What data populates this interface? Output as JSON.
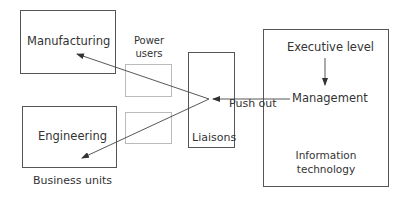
{
  "diagram": {
    "business_units": {
      "caption": "Business units",
      "manufacturing": "Manufacturing",
      "engineering": "Engineering"
    },
    "power_users": {
      "label_line1": "Power",
      "label_line2": "users"
    },
    "liaisons": {
      "label": "Liaisons"
    },
    "push_out": {
      "label": "Push out"
    },
    "information_technology": {
      "executive": "Executive level",
      "management": "Management",
      "label_line1": "Information",
      "label_line2": "technology"
    },
    "colors": {
      "stroke": "#555555",
      "light_stroke": "#bbbbbb",
      "text": "#333333"
    }
  }
}
